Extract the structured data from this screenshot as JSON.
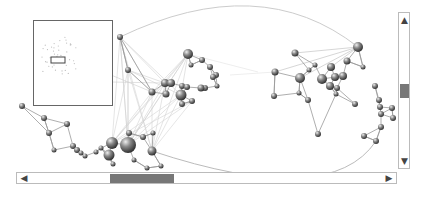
{
  "graph_view": {
    "left_cluster_nodes": [
      {
        "x": 120,
        "y": 37,
        "r": 3
      },
      {
        "x": 128,
        "y": 70,
        "r": 3
      },
      {
        "x": 188,
        "y": 54,
        "r": 5
      },
      {
        "x": 191,
        "y": 65,
        "r": 2.5
      },
      {
        "x": 202,
        "y": 60,
        "r": 3
      },
      {
        "x": 210,
        "y": 67,
        "r": 3
      },
      {
        "x": 216,
        "y": 75,
        "r": 3
      },
      {
        "x": 205,
        "y": 88,
        "r": 3
      },
      {
        "x": 213,
        "y": 77,
        "r": 3
      },
      {
        "x": 217,
        "y": 86,
        "r": 2.5
      },
      {
        "x": 165,
        "y": 83,
        "r": 4
      },
      {
        "x": 171,
        "y": 83,
        "r": 4
      },
      {
        "x": 182,
        "y": 86,
        "r": 3
      },
      {
        "x": 152,
        "y": 92,
        "r": 3.5
      },
      {
        "x": 166,
        "y": 94,
        "r": 3.5
      },
      {
        "x": 181,
        "y": 95,
        "r": 5.5
      },
      {
        "x": 187,
        "y": 87,
        "r": 3
      },
      {
        "x": 201,
        "y": 88,
        "r": 3.5
      },
      {
        "x": 192,
        "y": 101,
        "r": 3
      },
      {
        "x": 182,
        "y": 104,
        "r": 3
      },
      {
        "x": 22,
        "y": 106,
        "r": 3
      },
      {
        "x": 44,
        "y": 118,
        "r": 3
      },
      {
        "x": 67,
        "y": 124,
        "r": 3
      },
      {
        "x": 49,
        "y": 133,
        "r": 3
      },
      {
        "x": 54,
        "y": 150,
        "r": 2.5
      },
      {
        "x": 73,
        "y": 146,
        "r": 3
      },
      {
        "x": 77,
        "y": 150,
        "r": 3
      },
      {
        "x": 81,
        "y": 153,
        "r": 2.5
      },
      {
        "x": 85,
        "y": 156,
        "r": 2.5
      },
      {
        "x": 96,
        "y": 152,
        "r": 2.5
      },
      {
        "x": 101,
        "y": 148,
        "r": 2.5
      },
      {
        "x": 112,
        "y": 143,
        "r": 6
      },
      {
        "x": 109,
        "y": 155,
        "r": 5.5
      },
      {
        "x": 128,
        "y": 145,
        "r": 8
      },
      {
        "x": 129,
        "y": 133,
        "r": 3
      },
      {
        "x": 143,
        "y": 137,
        "r": 3
      },
      {
        "x": 152,
        "y": 151,
        "r": 4.5
      },
      {
        "x": 113,
        "y": 164,
        "r": 2.5
      },
      {
        "x": 134,
        "y": 160,
        "r": 2.5
      },
      {
        "x": 147,
        "y": 168,
        "r": 2.5
      },
      {
        "x": 161,
        "y": 166,
        "r": 2.5
      },
      {
        "x": 153,
        "y": 133,
        "r": 2.5
      }
    ],
    "right_cluster_nodes": [
      {
        "x": 295,
        "y": 53,
        "r": 3.5
      },
      {
        "x": 275,
        "y": 72,
        "r": 3.5
      },
      {
        "x": 300,
        "y": 78,
        "r": 5
      },
      {
        "x": 299,
        "y": 93,
        "r": 2.5
      },
      {
        "x": 309,
        "y": 70,
        "r": 2.5
      },
      {
        "x": 274,
        "y": 96,
        "r": 3
      },
      {
        "x": 308,
        "y": 100,
        "r": 3
      },
      {
        "x": 358,
        "y": 47,
        "r": 5
      },
      {
        "x": 347,
        "y": 61,
        "r": 3.5
      },
      {
        "x": 363,
        "y": 67,
        "r": 2.5
      },
      {
        "x": 315,
        "y": 65,
        "r": 2.5
      },
      {
        "x": 331,
        "y": 67,
        "r": 4
      },
      {
        "x": 322,
        "y": 79,
        "r": 5
      },
      {
        "x": 335,
        "y": 77,
        "r": 4
      },
      {
        "x": 343,
        "y": 76,
        "r": 4
      },
      {
        "x": 330,
        "y": 86,
        "r": 4
      },
      {
        "x": 337,
        "y": 88,
        "r": 3
      },
      {
        "x": 336,
        "y": 94,
        "r": 2.5
      },
      {
        "x": 375,
        "y": 86,
        "r": 3
      },
      {
        "x": 355,
        "y": 104,
        "r": 3
      },
      {
        "x": 380,
        "y": 107,
        "r": 3
      },
      {
        "x": 392,
        "y": 108,
        "r": 3
      },
      {
        "x": 381,
        "y": 114,
        "r": 3
      },
      {
        "x": 393,
        "y": 118,
        "r": 3
      },
      {
        "x": 318,
        "y": 134,
        "r": 3
      },
      {
        "x": 364,
        "y": 136,
        "r": 3
      },
      {
        "x": 376,
        "y": 141,
        "r": 3
      },
      {
        "x": 379,
        "y": 100,
        "r": 3
      },
      {
        "x": 381,
        "y": 127,
        "r": 3
      }
    ]
  },
  "overview": {
    "label": "overview-map",
    "viewport_indicator": {
      "x": 17,
      "y": 36,
      "w": 14,
      "h": 6
    }
  },
  "scrollbars": {
    "vertical": {
      "up_icon": "▲",
      "down_icon": "▼",
      "thumb_top": 71,
      "thumb_height": 14
    },
    "horizontal": {
      "left_icon": "◀",
      "right_icon": "▶",
      "thumb_left": 93,
      "thumb_width": 64
    }
  },
  "colors": {
    "node": "#555555",
    "edge": "#c8c8c8",
    "thumb": "#777777",
    "border": "#bbbbbb"
  }
}
